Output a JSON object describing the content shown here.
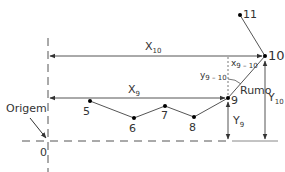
{
  "diagram": {
    "colors": {
      "line": "#555555",
      "text": "#333333",
      "background": "#ffffff"
    },
    "origin": {
      "label": "Origem",
      "value": "0"
    },
    "points": [
      {
        "id": "5",
        "label": "5",
        "x": 90,
        "y": 101
      },
      {
        "id": "6",
        "label": "6",
        "x": 134,
        "y": 118
      },
      {
        "id": "7",
        "label": "7",
        "x": 165,
        "y": 106
      },
      {
        "id": "8",
        "label": "8",
        "x": 194,
        "y": 117
      },
      {
        "id": "9",
        "label": "9",
        "x": 228,
        "y": 98
      },
      {
        "id": "10",
        "label": "10",
        "x": 265,
        "y": 56
      },
      {
        "id": "11",
        "label": "11",
        "x": 240,
        "y": 15
      }
    ],
    "labels": {
      "x10_main": "X",
      "x10_sub": "10",
      "x9_main": "X",
      "x9_sub": "9",
      "y9_main": "Y",
      "y9_sub": "9",
      "y10_main": "Y",
      "y10_sub": "10",
      "dx_main": "x",
      "dx_sub": "9 – 10",
      "dy_main": "y",
      "dy_sub": "9 – 10",
      "bearing": "Rumo"
    }
  }
}
